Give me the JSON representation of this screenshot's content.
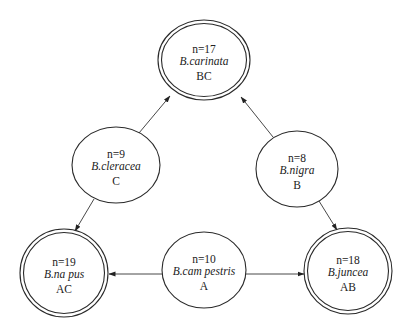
{
  "diagram": {
    "nodes": [
      {
        "id": "BC",
        "chromosome": "n=17",
        "species": "B.carinata",
        "genome": "BC",
        "type": "amphidiploid",
        "cx": 204,
        "cy": 60,
        "rx": 46,
        "ry": 40
      },
      {
        "id": "C",
        "chromosome": "n=9",
        "species": "B.cleracea",
        "genome": "C",
        "type": "diploid",
        "cx": 116,
        "cy": 165,
        "rx": 44,
        "ry": 38
      },
      {
        "id": "B",
        "chromosome": "n=8",
        "species": "B.nigra",
        "genome": "B",
        "type": "diploid",
        "cx": 297,
        "cy": 169,
        "rx": 41,
        "ry": 38
      },
      {
        "id": "AC",
        "chromosome": "n=19",
        "species": "B.na pus",
        "genome": "AC",
        "type": "amphidiploid",
        "cx": 64,
        "cy": 273,
        "rx": 44,
        "ry": 44
      },
      {
        "id": "A",
        "chromosome": "n=10",
        "species": "B.cam pestris",
        "genome": "A",
        "type": "diploid",
        "cx": 204,
        "cy": 270,
        "rx": 42,
        "ry": 38
      },
      {
        "id": "AB",
        "chromosome": "n=18",
        "species": "B.juncea",
        "genome": "AB",
        "type": "amphidiploid",
        "cx": 348,
        "cy": 271,
        "rx": 44,
        "ry": 43
      }
    ],
    "edges": [
      {
        "from": "C",
        "to": "BC",
        "x1": 139,
        "y1": 133,
        "x2": 170,
        "y2": 96
      },
      {
        "from": "B",
        "to": "BC",
        "x1": 273,
        "y1": 137,
        "x2": 241,
        "y2": 97
      },
      {
        "from": "C",
        "to": "AC",
        "x1": 94,
        "y1": 199,
        "x2": 75,
        "y2": 231
      },
      {
        "from": "B",
        "to": "AB",
        "x1": 319,
        "y1": 201,
        "x2": 337,
        "y2": 230
      },
      {
        "from": "A",
        "to": "AC",
        "x1": 162,
        "y1": 274,
        "x2": 109,
        "y2": 274
      },
      {
        "from": "A",
        "to": "AB",
        "x1": 246,
        "y1": 274,
        "x2": 304,
        "y2": 274
      }
    ],
    "colors": {
      "stroke": "#2a2a2a",
      "text": "#222222",
      "background": "#ffffff"
    }
  }
}
